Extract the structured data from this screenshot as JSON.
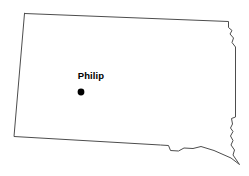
{
  "map": {
    "title": "South Dakota outline map",
    "region_name": "South Dakota",
    "background_color": "#ffffff",
    "outline_color": "#4d4d4d",
    "outline_width": 1,
    "fill_color": "#ffffff",
    "width": 249,
    "height": 176,
    "outline_path": "M 24.5 13.5 L 228.5 21.5 L 228.5 27.5 L 232.0 30.5 L 230.0 34.0 L 233.5 38.0 L 232.0 42.5 L 235.5 47.0 L 235.5 117.0 L 231.5 118.5 L 232.5 124.0 L 230.5 128.0 L 233.0 131.5 L 230.5 136.0 L 233.0 140.5 L 231.0 145.0 L 234.5 150.0 L 233.0 155.0 L 239.5 164.5 L 231.0 158.0 L 214.0 150.5 L 201.0 146.5 L 193.0 148.5 L 184.0 148.0 L 178.5 151.0 L 170.5 150.5 L 168.5 145.5 L 160.5 145.0 L 14.0 136.5 L 24.5 13.5 Z"
  },
  "cities": [
    {
      "name": "Philip",
      "label": "Philip",
      "marker_type": "filled-circle",
      "marker_color": "#000000",
      "marker_radius": 3.4,
      "x": 81,
      "y": 92,
      "label_x": 91,
      "label_y": 79
    }
  ]
}
